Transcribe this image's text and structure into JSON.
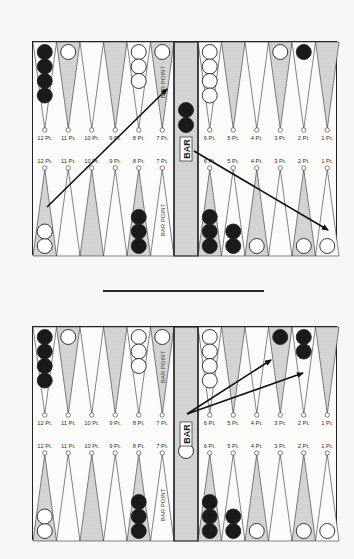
{
  "labels": {
    "bar": "BAR",
    "bar_point": "BAR POINT",
    "points_left": [
      "12 Pt.",
      "11 Pt.",
      "10 Pt.",
      "9 Pt.",
      "8 Pt.",
      "7 Pt."
    ],
    "points_right": [
      "6 Pt.",
      "5 Pt.",
      "4 Pt.",
      "3 Pt.",
      "2 Pt.",
      "1 Pt."
    ]
  },
  "colors": {
    "black_checker": "#1a1a1a",
    "white_checker": "#ffffff",
    "board_line": "#222222",
    "stipple": "#9a9a9a"
  },
  "boards": [
    {
      "id": "before-move",
      "top_checkers": {
        "12": {
          "color": "black",
          "count": 4
        },
        "11": {
          "color": "white",
          "count": 1
        },
        "8": {
          "color": "white",
          "count": 3
        },
        "7": {
          "color": "white",
          "count": 1
        },
        "6": {
          "color": "white",
          "count": 4
        },
        "3": {
          "color": "white",
          "count": 1
        },
        "2": {
          "color": "black",
          "count": 1
        }
      },
      "bottom_checkers": {
        "12": {
          "color": "white",
          "count": 2
        },
        "8": {
          "color": "black",
          "count": 3
        },
        "6": {
          "color": "black",
          "count": 3
        },
        "5": {
          "color": "black",
          "count": 2
        },
        "4": {
          "color": "white",
          "count": 1
        },
        "2": {
          "color": "white",
          "count": 1
        },
        "1": {
          "color": "white",
          "count": 1
        }
      },
      "bar_checkers": [
        {
          "color": "black",
          "position": "top",
          "count": 2
        }
      ],
      "arrows": [
        {
          "from": [
            14,
            165
          ],
          "to": [
            134,
            47
          ]
        },
        {
          "from": [
            161,
            109
          ],
          "to": [
            295,
            188
          ]
        }
      ]
    },
    {
      "id": "after-move",
      "top_checkers": {
        "12": {
          "color": "black",
          "count": 4
        },
        "11": {
          "color": "white",
          "count": 1
        },
        "8": {
          "color": "white",
          "count": 3
        },
        "7": {
          "color": "white",
          "count": 1
        },
        "6": {
          "color": "white",
          "count": 4
        },
        "3": {
          "color": "black",
          "count": 1
        },
        "2": {
          "color": "black",
          "count": 2
        }
      },
      "bottom_checkers": {
        "12": {
          "color": "white",
          "count": 2
        },
        "8": {
          "color": "black",
          "count": 3
        },
        "6": {
          "color": "black",
          "count": 3
        },
        "5": {
          "color": "black",
          "count": 2
        },
        "4": {
          "color": "white",
          "count": 1
        },
        "2": {
          "color": "white",
          "count": 1
        },
        "1": {
          "color": "white",
          "count": 1
        }
      },
      "bar_checkers": [
        {
          "color": "white",
          "position": "bottom",
          "count": 1
        }
      ],
      "arrows": [
        {
          "from": [
            154,
            87
          ],
          "to": [
            238,
            33
          ]
        },
        {
          "from": [
            154,
            87
          ],
          "to": [
            270,
            46
          ]
        }
      ]
    }
  ]
}
